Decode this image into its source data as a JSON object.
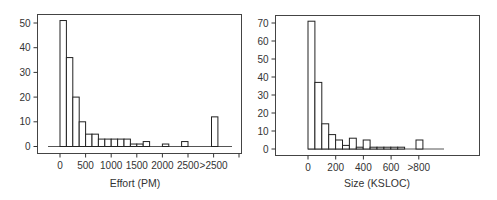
{
  "chart_data": [
    {
      "type": "bar",
      "title": "",
      "xlabel": "Effort (PM)",
      "ylabel": "",
      "ylim": [
        0,
        52
      ],
      "yticks": [
        0,
        10,
        20,
        30,
        40,
        50
      ],
      "xticks": [
        "0",
        "500",
        "1000",
        "1500",
        "2000",
        "2500",
        ">2500"
      ],
      "bin_width": 125,
      "categories": [
        "0-125",
        "125-250",
        "250-375",
        "375-500",
        "500-625",
        "625-750",
        "750-875",
        "875-1000",
        "1000-1125",
        "1125-1250",
        "1250-1375",
        "1375-1500",
        "1500-1625",
        "1625-1750",
        "1750-1875",
        "1875-2000",
        "2000-2125",
        "2125-2250",
        "2250-2375",
        "2375-2500",
        ">2500"
      ],
      "values": [
        51,
        36,
        20,
        10,
        5,
        5,
        3,
        3,
        3,
        3,
        3,
        1,
        1,
        2,
        0,
        0,
        1,
        0,
        0,
        2,
        12
      ],
      "grid": false,
      "legend": null
    },
    {
      "type": "bar",
      "title": "",
      "xlabel": "Size (KSLOC)",
      "ylabel": "",
      "ylim": [
        0,
        72
      ],
      "yticks": [
        0,
        10,
        20,
        30,
        40,
        50,
        60,
        70
      ],
      "xticks": [
        "0",
        "200",
        "400",
        "600",
        ">800"
      ],
      "bin_width": 50,
      "categories": [
        "0-50",
        "50-100",
        "100-150",
        "150-200",
        "200-250",
        "250-300",
        "300-350",
        "350-400",
        "400-450",
        "450-500",
        "500-550",
        "550-600",
        "600-650",
        "650-700",
        "700-750",
        "750-800",
        ">800"
      ],
      "values": [
        71,
        37,
        14,
        8,
        5,
        2,
        6,
        1,
        5,
        1,
        1,
        1,
        1,
        1,
        0,
        0,
        5
      ],
      "grid": false,
      "legend": null
    }
  ],
  "charts": {
    "left": {
      "xlabel": "Effort (PM)",
      "yticks": [
        "0",
        "10",
        "20",
        "30",
        "40",
        "50"
      ],
      "xticks": [
        "0",
        "500",
        "1000",
        "1500",
        "2000",
        "2500",
        ">2500"
      ]
    },
    "right": {
      "xlabel": "Size (KSLOC)",
      "yticks": [
        "0",
        "10",
        "20",
        "30",
        "40",
        "50",
        "60",
        "70"
      ],
      "xticks": [
        "0",
        "200",
        "400",
        "600",
        ">800"
      ]
    }
  }
}
